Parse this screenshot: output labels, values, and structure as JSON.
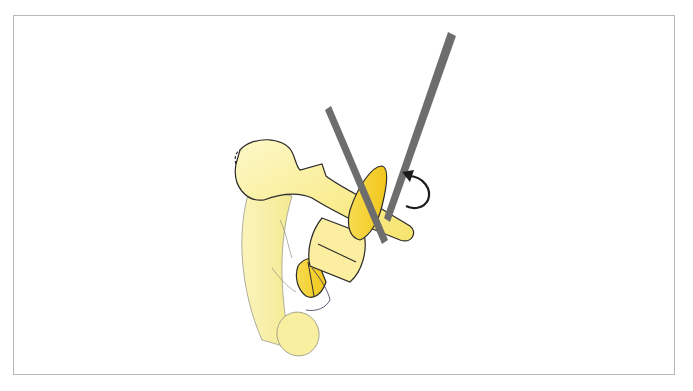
{
  "figure": {
    "frame": {
      "border_color": "#b8b8b8",
      "background": "#ffffff"
    },
    "colors": {
      "bone_fill_light": "#fbf4b8",
      "bone_fill_mid": "#f7e67a",
      "fragment_fill": "#f5cf2a",
      "fragment_fill_light": "#f8e47a",
      "outline": "#2b2b2b",
      "instrument": "#6d6d6d",
      "arrow": "#1c1c1c"
    },
    "elements": [
      {
        "name": "humeral-shaft",
        "label": ""
      },
      {
        "name": "humeral-head",
        "label": ""
      },
      {
        "name": "bone-fragment-yellow",
        "label": ""
      },
      {
        "name": "retractor-left",
        "label": ""
      },
      {
        "name": "retractor-right",
        "label": ""
      },
      {
        "name": "rotation-arrow",
        "label": ""
      }
    ]
  }
}
